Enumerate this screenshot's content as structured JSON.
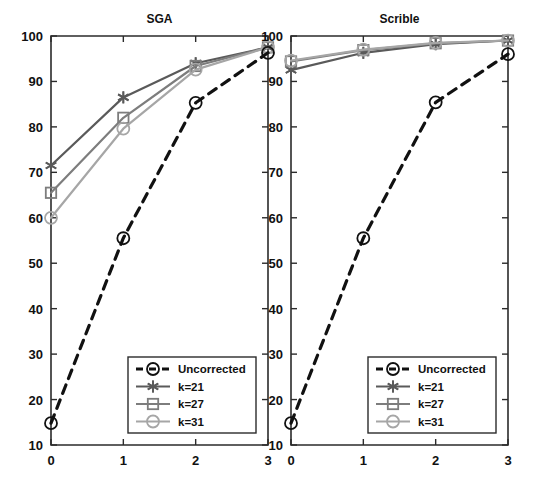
{
  "chart_data": {
    "type": "line",
    "title": "",
    "panels": [
      {
        "id": "sga",
        "title": "SGA",
        "xlabel": "",
        "ylabel": "",
        "x": [
          0,
          1,
          2,
          3
        ],
        "xlim": [
          0,
          3
        ],
        "ylim": [
          10,
          100
        ],
        "xticks": [
          "0",
          "1",
          "2",
          "3"
        ],
        "yticks": [
          "10",
          "20",
          "30",
          "40",
          "50",
          "60",
          "70",
          "80",
          "90",
          "100"
        ],
        "grid": false,
        "series": [
          {
            "name": "Uncorrected",
            "values": [
              14.8,
              55.5,
              85.3,
              96.3
            ],
            "style": "dashed",
            "marker": "circle",
            "color": "#111111"
          },
          {
            "name": "k=21",
            "values": [
              71.5,
              86.5,
              94.0,
              97.5
            ],
            "style": "solid",
            "marker": "asterisk",
            "color": "#5a5a5a"
          },
          {
            "name": "k=27",
            "values": [
              65.5,
              82.0,
              93.4,
              97.5
            ],
            "style": "solid",
            "marker": "square",
            "color": "#7d7d7d"
          },
          {
            "name": "k=31",
            "values": [
              60.0,
              79.6,
              92.6,
              97.5
            ],
            "style": "solid",
            "marker": "circle",
            "color": "#a6a6a6"
          }
        ]
      },
      {
        "id": "scrible",
        "title": "Scrible",
        "xlabel": "",
        "ylabel": "",
        "x": [
          0,
          1,
          2,
          3
        ],
        "xlim": [
          0,
          3
        ],
        "ylim": [
          10,
          100
        ],
        "xticks": [
          "0",
          "1",
          "2",
          "3"
        ],
        "yticks": [
          "10",
          "20",
          "30",
          "40",
          "50",
          "60",
          "70",
          "80",
          "90",
          "100"
        ],
        "grid": false,
        "series": [
          {
            "name": "Uncorrected",
            "values": [
              14.8,
              55.5,
              85.4,
              96.0
            ],
            "style": "dashed",
            "marker": "circle",
            "color": "#111111"
          },
          {
            "name": "k=21",
            "values": [
              92.5,
              96.3,
              98.2,
              99.0
            ],
            "style": "solid",
            "marker": "asterisk",
            "color": "#5a5a5a"
          },
          {
            "name": "k=27",
            "values": [
              94.4,
              96.9,
              98.4,
              99.0
            ],
            "style": "solid",
            "marker": "square",
            "color": "#7d7d7d"
          },
          {
            "name": "k=31",
            "values": [
              94.6,
              97.0,
              98.5,
              99.0
            ],
            "style": "solid",
            "marker": "circle",
            "color": "#a6a6a6"
          }
        ]
      }
    ],
    "legend": {
      "position": "lower-right",
      "entries": [
        {
          "label": "Uncorrected",
          "style": "dashed",
          "marker": "circle",
          "color": "#111111"
        },
        {
          "label": "k=21",
          "style": "solid",
          "marker": "asterisk",
          "color": "#5a5a5a"
        },
        {
          "label": "k=27",
          "style": "solid",
          "marker": "square",
          "color": "#7d7d7d"
        },
        {
          "label": "k=31",
          "style": "solid",
          "marker": "circle",
          "color": "#a6a6a6"
        }
      ]
    },
    "colors": {
      "axis": "#2b2b2b",
      "text": "#111111",
      "background": "#ffffff",
      "uncorrected": "#111111",
      "k21": "#5a5a5a",
      "k27": "#7d7d7d",
      "k31": "#a6a6a6"
    }
  }
}
